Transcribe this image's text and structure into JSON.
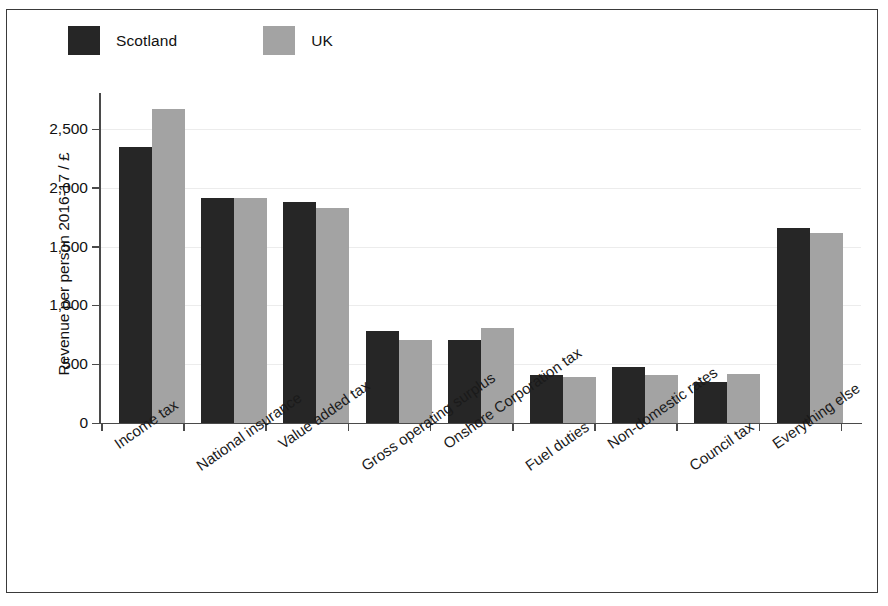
{
  "figure": {
    "legend": {
      "position": "top-left",
      "entries": [
        {
          "label": "Scotland",
          "color": "#262626",
          "key": "scotland"
        },
        {
          "label": "UK",
          "color": "#a3a3a3",
          "key": "uk"
        }
      ]
    }
  },
  "chart_data": {
    "type": "bar",
    "title": "",
    "xlabel": "",
    "ylabel": "Revenue per person 2016-17 / £",
    "ylim": [
      0,
      2800
    ],
    "yticks": [
      0,
      500,
      1000,
      1500,
      2000,
      2500
    ],
    "ytick_labels": [
      "0",
      "500",
      "1,000",
      "1,500",
      "2,000",
      "2,500"
    ],
    "grid": true,
    "legend_position": "top-left",
    "categories": [
      "Income tax",
      "National insurance",
      "Value added tax",
      "Gross operating surplus",
      "Onshore Corporation tax",
      "Fuel duties",
      "Non-domestic rates",
      "Council tax",
      "Everything else"
    ],
    "series": [
      {
        "name": "Scotland",
        "color": "#262626",
        "values": [
          2350,
          1910,
          1880,
          785,
          705,
          410,
          475,
          350,
          1660
        ]
      },
      {
        "name": "UK",
        "color": "#a3a3a3",
        "values": [
          2670,
          1910,
          1825,
          705,
          810,
          395,
          410,
          420,
          1620
        ]
      }
    ]
  }
}
